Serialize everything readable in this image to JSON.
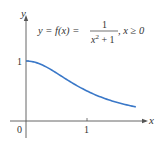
{
  "chart_data": {
    "type": "line",
    "equation": {
      "lhs": "y = f(x) =",
      "numerator": "1",
      "denominator_base": "x",
      "denominator_exp": "2",
      "denominator_rest": " + 1",
      "condition": ", x ≥ 0"
    },
    "xlabel": "x",
    "ylabel": "y",
    "x_ticks": [
      "0",
      "1"
    ],
    "y_ticks": [
      "1"
    ],
    "origin_label": "0",
    "xlim": [
      0,
      1.8
    ],
    "ylim": [
      0,
      1
    ],
    "grid": false,
    "series": [
      {
        "name": "f(x) = 1/(x^2+1)",
        "color": "#3a78c8",
        "x": [
          0,
          0.2,
          0.4,
          0.6,
          0.8,
          1.0,
          1.2,
          1.4,
          1.6,
          1.8
        ],
        "y": [
          1.0,
          0.962,
          0.862,
          0.735,
          0.61,
          0.5,
          0.41,
          0.338,
          0.281,
          0.236
        ]
      }
    ]
  }
}
